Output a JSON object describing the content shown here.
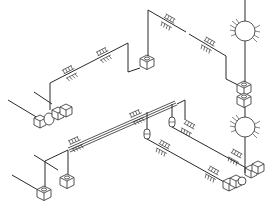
{
  "diagram": {
    "type": "isometric-piping-schematic",
    "background": "#ffffff",
    "line_color": "#2a2a2a",
    "symbols": {
      "support": "pipe-support-symbol",
      "box": "isometric-box-fixture",
      "valve": "valve-symbol",
      "pump": "circular-pump-symbol",
      "capsule": "inline-fitting-symbol"
    }
  }
}
